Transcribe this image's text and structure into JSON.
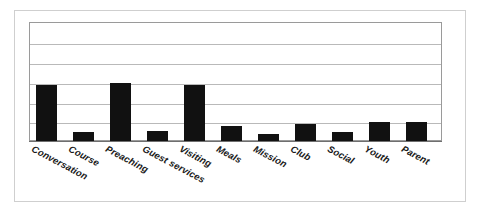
{
  "chart_data": {
    "type": "bar",
    "title": "",
    "subtitle": "",
    "xlabel": "",
    "ylabel": "",
    "categories": [
      "Conversation",
      "Course",
      "Preaching",
      "Guest services",
      "Visiting",
      "Meals",
      "Mission",
      "Club",
      "Social",
      "Youth",
      "Parent"
    ],
    "values": [
      2.83,
      0.45,
      2.93,
      0.5,
      2.83,
      0.76,
      0.35,
      0.86,
      0.45,
      0.96,
      0.96
    ],
    "ylim": [
      0,
      6
    ],
    "y_tick_values": [
      0,
      1,
      2,
      3,
      4,
      5,
      6
    ],
    "y_tick_labels": [
      "",
      "",
      "",
      "",
      "",
      "",
      ""
    ],
    "grid": true,
    "grid_axis": "y",
    "legend": false,
    "legend_position": "none",
    "bar_color": "#111111",
    "gridline_color": "#b9b9b9",
    "axis_color": "#6f6f6f",
    "plot_border_color": "#9a9a9a",
    "outer_border_color": "#cfcfcf",
    "background_color": "#ffffff",
    "label_rotation_degrees": 28,
    "bar_width_px": 21,
    "bar_pitch_px": 37
  },
  "figure": {
    "width_px": 484,
    "height_px": 219
  }
}
